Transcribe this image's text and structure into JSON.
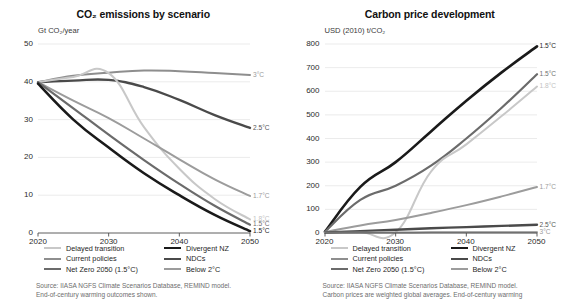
{
  "chart_data": [
    {
      "type": "line",
      "panel": "left",
      "title": "CO₂ emissions by scenario",
      "ylabel": "Gt CO₂/year",
      "xlabel": "",
      "xticks": [
        "2020",
        "2030",
        "2040",
        "2050"
      ],
      "yticks": [
        "0",
        "10",
        "20",
        "30",
        "40",
        "50"
      ],
      "xlim": [
        2020,
        2050
      ],
      "ylim": [
        0,
        50
      ],
      "grid": true,
      "legend_position": "below",
      "x": [
        2020,
        2025,
        2030,
        2035,
        2040,
        2045,
        2050
      ],
      "series": [
        {
          "name": "Current policies",
          "color": "#8e8e8e",
          "width": 2.0,
          "end_label": "3°C",
          "end_label_color": "#9a9a9a",
          "values": [
            39.9,
            41.6,
            42.4,
            43.0,
            42.8,
            42.3,
            41.8
          ]
        },
        {
          "name": "NDCs",
          "color": "#4a4a4a",
          "width": 2.4,
          "end_label": "2.5°C",
          "end_label_color": "#565656",
          "values": [
            39.9,
            40.3,
            40.5,
            38.6,
            35.2,
            31.2,
            27.8
          ]
        },
        {
          "name": "Delayed transition",
          "color": "#c8c8c8",
          "width": 2.0,
          "end_label": "1.8°C",
          "end_label_color": "#c2c2c2",
          "values": [
            39.9,
            41.3,
            42.3,
            28.0,
            17.0,
            9.0,
            3.6
          ]
        },
        {
          "name": "Below 2°C",
          "color": "#9c9c9c",
          "width": 2.0,
          "end_label": "1.7°C",
          "end_label_color": "#9a9a9a",
          "values": [
            39.9,
            35.0,
            30.4,
            25.0,
            19.5,
            14.2,
            9.8
          ]
        },
        {
          "name": "Net Zero 2050 (1.5°C)",
          "color": "#6b6b6b",
          "width": 2.2,
          "end_label": "1.5°C",
          "end_label_color": "#6f6f6f",
          "values": [
            39.9,
            33.0,
            26.0,
            19.3,
            13.0,
            7.2,
            2.2
          ]
        },
        {
          "name": "Divergent NZ",
          "color": "#1a1a1a",
          "width": 2.6,
          "end_label": "1.5°C",
          "end_label_color": "#1f1f1f",
          "values": [
            39.5,
            30.0,
            22.6,
            15.8,
            10.0,
            4.8,
            0.5
          ]
        }
      ],
      "source": [
        "Source: IIASA NGFS Climate Scenarios Database, REMIND model.",
        "End-of-century warming outcomes shown."
      ]
    },
    {
      "type": "line",
      "panel": "right",
      "title": "Carbon price development",
      "ylabel": "USD (2010) t/CO₂",
      "xlabel": "",
      "xticks": [
        "2020",
        "2030",
        "2040",
        "2050"
      ],
      "yticks": [
        "0",
        "100",
        "200",
        "300",
        "400",
        "500",
        "600",
        "700",
        "800"
      ],
      "xlim": [
        2020,
        2050
      ],
      "ylim": [
        0,
        800
      ],
      "grid": true,
      "legend_position": "below",
      "x": [
        2020,
        2025,
        2030,
        2035,
        2040,
        2045,
        2050
      ],
      "series": [
        {
          "name": "Divergent NZ",
          "color": "#1a1a1a",
          "width": 2.6,
          "end_label": "1.5°C",
          "end_label_color": "#1f1f1f",
          "values": [
            6,
            195,
            300,
            430,
            560,
            680,
            790
          ]
        },
        {
          "name": "Net Zero 2050 (1.5°C)",
          "color": "#6b6b6b",
          "width": 2.2,
          "end_label": "1.5°C",
          "end_label_color": "#6f6f6f",
          "values": [
            5,
            140,
            200,
            285,
            400,
            530,
            672
          ]
        },
        {
          "name": "Delayed transition",
          "color": "#c8c8c8",
          "width": 2.0,
          "end_label": "1.8°C",
          "end_label_color": "#c2c2c2",
          "values": [
            3,
            3,
            3,
            260,
            375,
            495,
            620
          ]
        },
        {
          "name": "Below 2°C",
          "color": "#9c9c9c",
          "width": 2.0,
          "end_label": "1.7°C",
          "end_label_color": "#9a9a9a",
          "values": [
            4,
            32,
            55,
            85,
            118,
            155,
            195
          ]
        },
        {
          "name": "NDCs",
          "color": "#4a4a4a",
          "width": 2.4,
          "end_label": "2.5°C",
          "end_label_color": "#565656",
          "values": [
            2,
            8,
            14,
            20,
            25,
            30,
            35
          ]
        },
        {
          "name": "Current policies",
          "color": "#8e8e8e",
          "width": 2.0,
          "end_label": "3°C",
          "end_label_color": "#9a9a9a",
          "values": [
            1,
            2,
            2,
            3,
            3,
            3,
            3
          ]
        }
      ],
      "source": [
        "Source: IIASA NGFS Climate Scenarios Database, REMIND model.",
        "Carbon prices are weighted global averages. End-of-century warming"
      ]
    }
  ],
  "legend": {
    "rows": [
      [
        {
          "label": "Delayed transition",
          "color": "#c8c8c8",
          "width": 2.0
        },
        {
          "label": "Divergent NZ",
          "color": "#1a1a1a",
          "width": 2.8
        }
      ],
      [
        {
          "label": "Current policies",
          "color": "#8e8e8e",
          "width": 2.2
        },
        {
          "label": "NDCs",
          "color": "#4a4a4a",
          "width": 2.6
        }
      ],
      [
        {
          "label": "Net Zero 2050 (1.5°C)",
          "color": "#6b6b6b",
          "width": 2.4
        },
        {
          "label": "Below 2°C",
          "color": "#9c9c9c",
          "width": 2.0
        }
      ]
    ]
  },
  "colors": {
    "grid": "#e2e2e2",
    "axis": "#4d4d4d",
    "text": "#1c1c1c",
    "source_text": "#6d6d6d"
  }
}
